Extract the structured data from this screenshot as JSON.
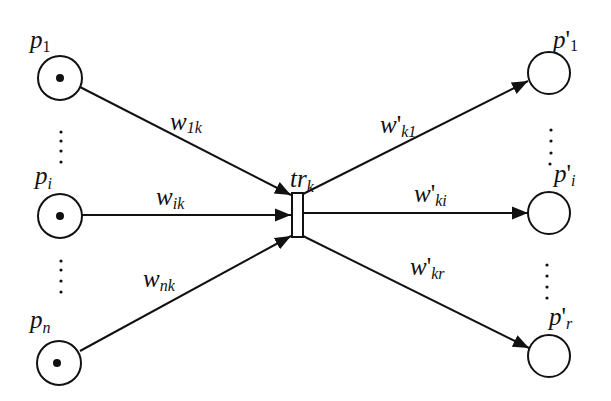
{
  "diagram": {
    "type": "petri-net-transition",
    "colors": {
      "stroke": "#111111",
      "fill": "#ffffff",
      "token": "#111111"
    },
    "transition": {
      "id": "tr_k",
      "label": {
        "base": "tr",
        "sub": "k"
      },
      "x": 292,
      "y": 193,
      "w": 11,
      "h": 44
    },
    "input_places": [
      {
        "id": "p1",
        "label": {
          "base": "p",
          "sub": "1"
        },
        "cx": 60,
        "cy": 78,
        "r": 22,
        "token": true
      },
      {
        "id": "pi",
        "label": {
          "base": "p",
          "sub": "i"
        },
        "cx": 60,
        "cy": 216,
        "r": 22,
        "token": true
      },
      {
        "id": "pn",
        "label": {
          "base": "p",
          "sub": "n"
        },
        "cx": 59,
        "cy": 363,
        "r": 22,
        "token": true
      }
    ],
    "output_places": [
      {
        "id": "p'1",
        "label": {
          "base": "p",
          "prime": "'",
          "sub": "1"
        },
        "cx": 549,
        "cy": 73,
        "r": 21,
        "token": false
      },
      {
        "id": "p'i",
        "label": {
          "base": "p",
          "prime": "'",
          "sub": "i"
        },
        "cx": 549,
        "cy": 213,
        "r": 21,
        "token": false
      },
      {
        "id": "p'r",
        "label": {
          "base": "p",
          "prime": "'",
          "sub": "r"
        },
        "cx": 549,
        "cy": 356,
        "r": 21,
        "token": false
      }
    ],
    "input_arcs": [
      {
        "from": "p1",
        "to": "tr_k",
        "weight": {
          "base": "w",
          "sub": "1k"
        }
      },
      {
        "from": "pi",
        "to": "tr_k",
        "weight": {
          "base": "w",
          "sub": "ik"
        }
      },
      {
        "from": "pn",
        "to": "tr_k",
        "weight": {
          "base": "w",
          "sub": "nk"
        }
      }
    ],
    "output_arcs": [
      {
        "from": "tr_k",
        "to": "p'1",
        "weight": {
          "base": "w",
          "prime": "'",
          "sub": "k1"
        }
      },
      {
        "from": "tr_k",
        "to": "p'i",
        "weight": {
          "base": "w",
          "prime": "'",
          "sub": "ki"
        }
      },
      {
        "from": "tr_k",
        "to": "p'r",
        "weight": {
          "base": "w",
          "prime": "'",
          "sub": "kr"
        }
      }
    ],
    "ellipsis": "⋮"
  }
}
